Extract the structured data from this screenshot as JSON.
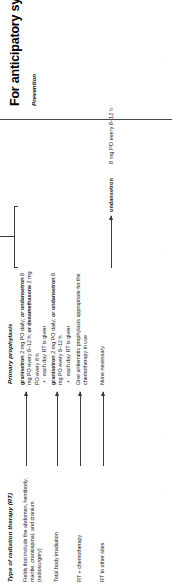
{
  "document": {
    "orientation": "rotated-90-ccw",
    "background_color": "#ffffff",
    "text_color": "#222222"
  },
  "table": {
    "headers": {
      "left": "Type of radiation therapy (RT)",
      "right": "Primary prophylaxis"
    },
    "rows": [
      {
        "radiation_type": "Fields that include the abdomen, hemibody, mantle, craniospinal, and cranium (radiosurgery)",
        "prophylaxis_drug_1": "granisetron",
        "prophylaxis_dose_1": " 2 mg PO daily; ",
        "prophylaxis_or_1": "or",
        "prophylaxis_drug_2": "ondansetron",
        "prophylaxis_dose_2": " 8 mg PO every 8–12 h; ",
        "prophylaxis_or_2": "or",
        "prophylaxis_drug_3": "dexamethasone",
        "prophylaxis_dose_3": " 2 mg PO every 8 h",
        "prophylaxis_bullet": "each day RT is given"
      },
      {
        "radiation_type": "Total body irradiation",
        "prophylaxis_drug_1": "granisetron",
        "prophylaxis_dose_1": " 2 mg PO daily; ",
        "prophylaxis_or_1": "or",
        "prophylaxis_drug_2": "ondansetron",
        "prophylaxis_dose_2": " 8 mg PO every 8–12 h",
        "prophylaxis_bullet": "each day RT is given"
      },
      {
        "radiation_type": "RT + chemotherapy",
        "prophylaxis_text": "Give antiemetic prophylaxis appropriate for the chemotherapy in use"
      },
      {
        "radiation_type": "RT to other sites",
        "prophylaxis_text": "None necessary"
      }
    ],
    "escalation_note": "Add agents from other pharmacologic classes (see Treatment for breakthrough symptoms following Chemotherapy)",
    "breakthrough_row": {
      "drug": "ondansetron",
      "dose": "8 mg PO every 8–12 h"
    }
  },
  "next_section": {
    "title": "For anticipatory symptoms",
    "subtitle": "Prevention"
  }
}
